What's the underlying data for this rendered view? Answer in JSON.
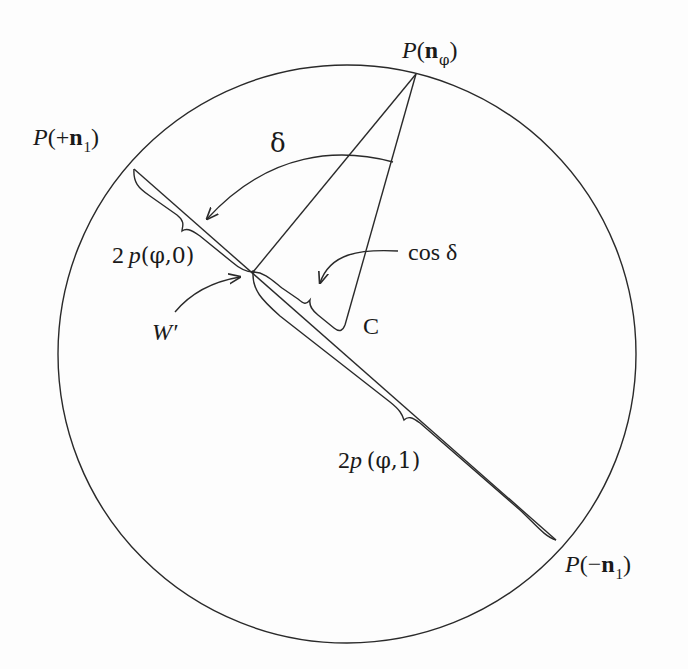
{
  "diagram": {
    "type": "geometric construction",
    "circle": {
      "cx": 347,
      "cy": 354,
      "r": 289
    },
    "points": {
      "p_n_phi": {
        "x": 416,
        "y": 74
      },
      "p_plus_n1": {
        "x": 134,
        "y": 169
      },
      "p_minus_n1": {
        "x": 556,
        "y": 540
      },
      "w_prime": {
        "x": 253,
        "y": 272
      },
      "c": {
        "x": 345,
        "y": 325
      }
    },
    "labels": {
      "p_n_phi": {
        "P": "P",
        "open": "(",
        "n": "n",
        "sub": "φ",
        "close": ")"
      },
      "p_plus_n1": {
        "P": "P",
        "open": "(+",
        "n": "n",
        "sub": "1",
        "close": ")"
      },
      "p_minus_n1": {
        "P": "P",
        "open": "(−",
        "n": "n",
        "sub": "1",
        "close": ")"
      },
      "delta": "δ",
      "two_p_phi_0": {
        "coef": "2",
        "p": "p",
        "args": "(φ,0)"
      },
      "two_p_phi_1": {
        "coef": "2",
        "p": "p",
        "args": "(φ,1)"
      },
      "cos_delta": "cos δ",
      "w_prime": "W′",
      "c": "C"
    },
    "stroke_color": "#2a2a2a",
    "text_color": "#1a1a1a"
  }
}
